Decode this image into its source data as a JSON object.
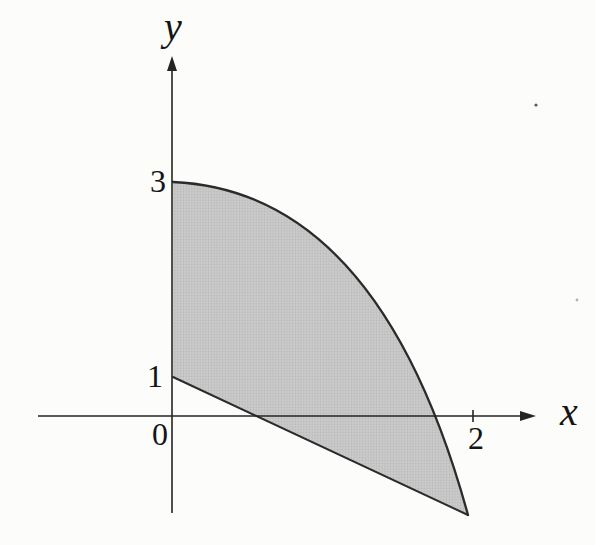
{
  "figure": {
    "labels": {
      "y_axis": "y",
      "x_axis": "x",
      "y_tick_3": "3",
      "y_tick_1": "1",
      "origin": "0",
      "x_tick_2": "2"
    },
    "colors": {
      "background": "#fcfcfa",
      "ink": "#242424",
      "text": "#141414",
      "region_base": "#cdcdcd",
      "region_dot": "#b5b5b5"
    },
    "artifacts": [
      {
        "x": 536,
        "y": 105,
        "r": 1.6,
        "color": "#5a5a5a"
      },
      {
        "x": 577,
        "y": 300,
        "r": 1.4,
        "color": "#b3b3b3"
      }
    ]
  },
  "chart_data": {
    "type": "area",
    "title": "",
    "xlabel": "x",
    "ylabel": "y",
    "grid": false,
    "axis_arrows": true,
    "x_ticks": [
      {
        "value": 0,
        "label": "0"
      },
      {
        "value": 2,
        "label": "2"
      }
    ],
    "y_ticks": [
      {
        "value": 1,
        "label": "1"
      },
      {
        "value": 3,
        "label": "3"
      }
    ],
    "region": {
      "description": "Gray halftone-shaded region bounded on the left by the y-axis between (0,1) and (0,3), above by a concave-down decreasing curve starting at (0,3) that crosses the x-axis near x=1.7, and below by a straight line starting at (0,1) that crosses the x-axis near x=0.6; curve and line meet at a vertex below the x-axis at x=2.",
      "upper_boundary": {
        "shape": "curve",
        "from": [
          0,
          3
        ],
        "x_intercept_estimate": 1.7,
        "to_estimate": [
          2,
          -1
        ]
      },
      "lower_boundary": {
        "shape": "line",
        "from": [
          0,
          1
        ],
        "x_intercept_estimate": 0.6,
        "to_estimate": [
          2,
          -1
        ]
      }
    },
    "layout_px": {
      "canvas": [
        595,
        545
      ],
      "x_axis": {
        "line": [
          [
            38,
            416
          ],
          [
            522,
            416
          ]
        ],
        "arrow": [
          [
            536,
            416
          ],
          [
            520,
            411
          ],
          [
            520,
            421
          ]
        ]
      },
      "y_axis": {
        "line": [
          [
            172,
            513
          ],
          [
            172,
            70
          ]
        ],
        "arrow": [
          [
            172,
            56
          ],
          [
            167,
            71
          ],
          [
            177,
            71
          ]
        ]
      },
      "tick2": [
        473,
        410,
        473,
        422
      ],
      "region": {
        "start": [
          173,
          182
        ],
        "control": [
          379,
          191
        ],
        "vertex": [
          468,
          515
        ],
        "line_end": [
          173,
          377
        ]
      },
      "labels": {
        "label-y": [
          173,
          40
        ],
        "label-x": [
          560,
          425
        ],
        "label-3": [
          166,
          192
        ],
        "label-1": [
          163,
          387
        ],
        "label-0": [
          168,
          445
        ],
        "label-2": [
          476,
          449
        ]
      }
    }
  }
}
